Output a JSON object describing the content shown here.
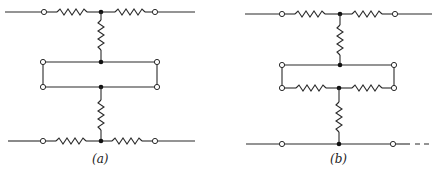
{
  "figure": {
    "panels": [
      {
        "id": "a",
        "label": "(a)",
        "description": "Two T-networks (series arms on outer lines, shunt arm vertical) connected back-to-back through a plain rectangular loop between inner terminals"
      },
      {
        "id": "b",
        "label": "(b)",
        "description": "Upper T-network whose shunt arm connects to a rectangular loop; lower side of the loop contains two series resistors meeting at a junction, from which a shunt resistor goes down to a plain bottom line"
      }
    ]
  },
  "colors": {
    "line": "#2a2a2a",
    "node": "#111111",
    "background": "#ffffff"
  }
}
